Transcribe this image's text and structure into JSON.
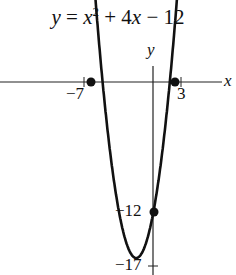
{
  "chart_data": {
    "type": "line",
    "equation": "y = x^2 + 4x - 12",
    "xlabel": "x",
    "ylabel": "y",
    "tick_labels": {
      "x": [
        "−7",
        "3"
      ],
      "y": [
        "−12",
        "−17"
      ]
    },
    "marked_points": [
      {
        "x": -7,
        "y": 0
      },
      {
        "x": 3,
        "y": 0
      },
      {
        "x": 0,
        "y": -12
      }
    ],
    "vertex": {
      "x": -2,
      "y": -16
    },
    "grid": false
  },
  "labels": {
    "title_y": "y",
    "title_eq_a": " = ",
    "title_x": "x",
    "title_sup": "2",
    "title_rest": " + 4",
    "title_x2": "x",
    "title_end": " − 12",
    "axis_y": "y",
    "axis_x": "x",
    "tick_neg7": "−7",
    "tick_3": "3",
    "tick_neg12": "−12",
    "tick_neg17": "−17"
  }
}
